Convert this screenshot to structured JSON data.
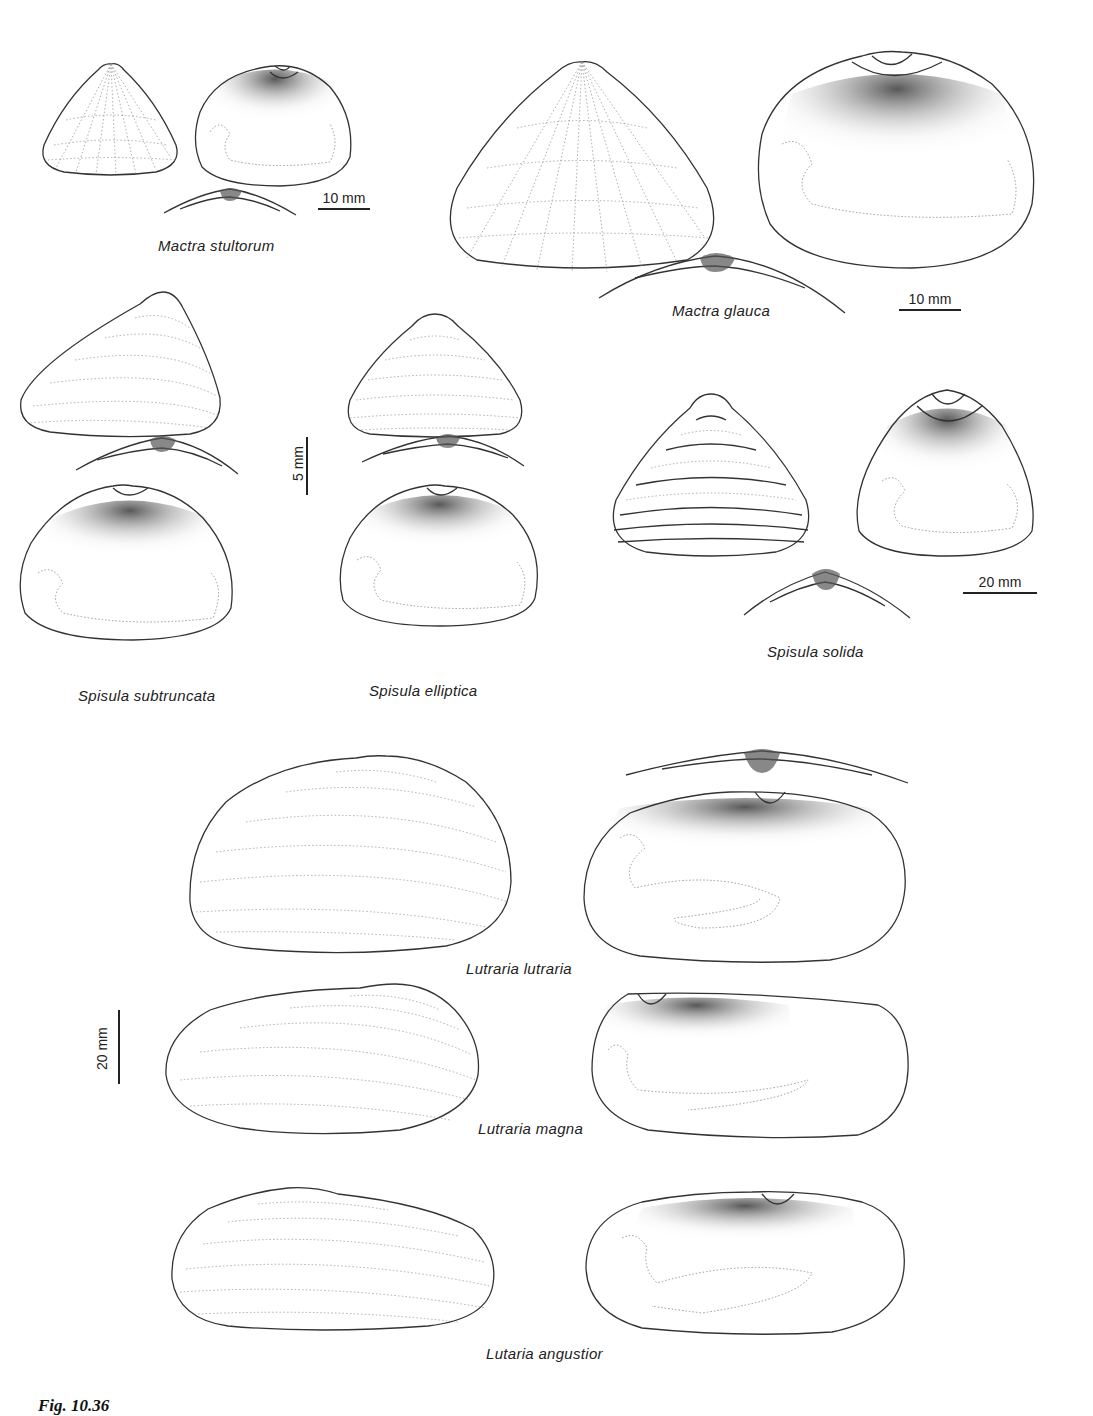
{
  "plate": {
    "figure_label": "Fig. 10.36",
    "background": "#ffffff",
    "ink_color": "#222222"
  },
  "species": [
    {
      "id": "mactra-stultorum",
      "label": "Mactra stultorum",
      "views": [
        "exterior",
        "interior",
        "hinge"
      ],
      "scale": "10 mm"
    },
    {
      "id": "mactra-glauca",
      "label": "Mactra glauca",
      "views": [
        "exterior",
        "interior",
        "hinge"
      ],
      "scale": "10 mm"
    },
    {
      "id": "spisula-subtruncata",
      "label": "Spisula subtruncata",
      "views": [
        "exterior",
        "hinge",
        "interior"
      ]
    },
    {
      "id": "spisula-elliptica",
      "label": "Spisula elliptica",
      "views": [
        "exterior",
        "hinge",
        "interior"
      ]
    },
    {
      "id": "spisula-solida",
      "label": "Spisula solida",
      "views": [
        "exterior",
        "interior",
        "hinge"
      ],
      "scale": "20 mm"
    },
    {
      "id": "lutraria-lutraria",
      "label": "Lutraria lutraria",
      "views": [
        "exterior",
        "hinge",
        "interior"
      ]
    },
    {
      "id": "lutraria-magna",
      "label": "Lutraria magna",
      "views": [
        "exterior",
        "interior"
      ]
    },
    {
      "id": "lutaria-angustior",
      "label": "Lutaria angustior",
      "views": [
        "exterior",
        "interior"
      ]
    }
  ],
  "scales": {
    "mactra_stultorum": "10 mm",
    "mactra_glauca": "10 mm",
    "spisula_small": "5 mm",
    "spisula_solida": "20 mm",
    "lutraria": "20 mm"
  },
  "labels": {
    "mactra_stultorum": "Mactra stultorum",
    "mactra_glauca": "Mactra glauca",
    "spisula_subtruncata": "Spisula subtruncata",
    "spisula_elliptica": "Spisula elliptica",
    "spisula_solida": "Spisula solida",
    "lutraria_lutraria": "Lutraria lutraria",
    "lutraria_magna": "Lutraria magna",
    "lutaria_angustior": "Lutaria angustior"
  }
}
